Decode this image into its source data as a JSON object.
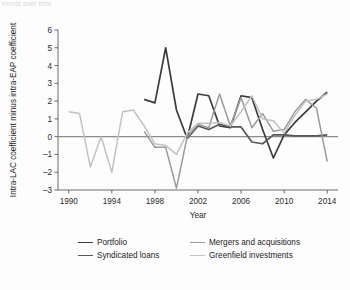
{
  "caption": "trends over time",
  "chart_data": {
    "type": "line",
    "title": "",
    "xlabel": "Year",
    "ylabel": "Intra-LAC coefficient minus intra-EAP coefficient",
    "xlim": [
      1989,
      2015
    ],
    "ylim": [
      -3,
      6
    ],
    "xticks": [
      1990,
      1994,
      1998,
      2002,
      2006,
      2010,
      2014
    ],
    "yticks": [
      -3,
      -2,
      -1,
      0,
      1,
      2,
      3,
      4,
      5,
      6
    ],
    "grid": false,
    "zero_line": true,
    "legend_position": "below",
    "colors": {
      "portfolio": "#3b3b3b",
      "syndicated_loans": "#575757",
      "mergers_and_acquisitions": "#9a9a9a",
      "greenfield_investments": "#c2c2c2",
      "axis": "#5a5a5a",
      "zero_line": "#8c8c8c",
      "text": "#1f1f1f",
      "background": "#fdfdfd"
    },
    "series": [
      {
        "name": "Portfolio",
        "color_key": "portfolio",
        "x": [
          1997,
          1998,
          1999,
          2000,
          2001,
          2002,
          2003,
          2004,
          2005,
          2006,
          2007,
          2008,
          2009,
          2010,
          2011,
          2012,
          2013,
          2014
        ],
        "values": [
          2.1,
          1.9,
          5.0,
          1.5,
          -0.1,
          2.4,
          2.3,
          0.6,
          0.5,
          2.3,
          2.2,
          0.4,
          -1.2,
          0.1,
          0.8,
          1.4,
          2.0,
          2.5
        ]
      },
      {
        "name": "Syndicated loans",
        "color_key": "syndicated_loans",
        "x": [
          2001,
          2002,
          2003,
          2004,
          2005,
          2006,
          2007,
          2008,
          2009,
          2010,
          2011,
          2012,
          2013,
          2014
        ],
        "values": [
          -0.1,
          0.6,
          0.4,
          0.7,
          0.55,
          0.55,
          -0.3,
          -0.4,
          0.1,
          0.1,
          0.05,
          0.05,
          0.05,
          0.1
        ]
      },
      {
        "name": "Mergers and acquisitions",
        "color_key": "mergers_and_acquisitions",
        "x": [
          1997,
          1998,
          1999,
          2000,
          2001,
          2002,
          2003,
          2004,
          2005,
          2006,
          2007,
          2008,
          2009,
          2010,
          2011,
          2012,
          2013,
          2014
        ],
        "values": [
          0.3,
          -0.6,
          -0.6,
          -2.9,
          0.0,
          0.7,
          0.5,
          2.4,
          0.6,
          2.2,
          0.5,
          1.3,
          0.3,
          0.4,
          1.4,
          2.1,
          1.6,
          -1.4
        ]
      },
      {
        "name": "Greenfield investments",
        "color_key": "greenfield_investments",
        "x": [
          1990,
          1991,
          1992,
          1993,
          1994,
          1995,
          1996,
          1997,
          1998,
          1999,
          2000,
          2001,
          2002,
          2003,
          2004,
          2005,
          2006,
          2007,
          2008,
          2009,
          2010,
          2011,
          2012,
          2013,
          2014
        ],
        "values": [
          1.4,
          1.3,
          -1.7,
          0.0,
          -2.0,
          1.4,
          1.5,
          0.6,
          -0.4,
          -0.5,
          -1.0,
          0.2,
          0.75,
          0.75,
          0.8,
          0.6,
          1.4,
          2.3,
          1.0,
          0.9,
          0.2,
          1.2,
          2.0,
          2.1,
          2.4
        ]
      }
    ]
  },
  "legend": {
    "items": [
      {
        "label": "Portfolio",
        "color_key": "portfolio"
      },
      {
        "label": "Mergers and acquisitions",
        "color_key": "mergers_and_acquisitions"
      },
      {
        "label": "Syndicated loans",
        "color_key": "syndicated_loans"
      },
      {
        "label": "Greenfield investments",
        "color_key": "greenfield_investments"
      }
    ]
  }
}
